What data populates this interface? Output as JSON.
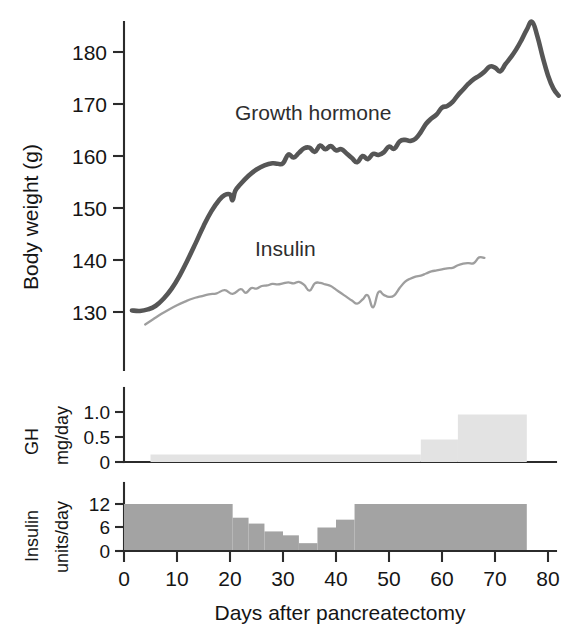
{
  "figure": {
    "title": "",
    "background_color": "#ffffff"
  },
  "chart_data": {
    "type": "line",
    "title": "",
    "subtitle": "",
    "xlabel": "Days after pancreatectomy",
    "ylabel": "Body weight (g)",
    "xlim": [
      -2,
      86
    ],
    "ylim": [
      124,
      188
    ],
    "grid": false,
    "legend_position": "inline-annotation",
    "x_ticks": [
      0,
      10,
      20,
      30,
      40,
      50,
      60,
      70,
      80
    ],
    "x_tick_labels": [
      "0",
      "10",
      "20",
      "30",
      "40",
      "50",
      "60",
      "70",
      "80"
    ],
    "y_ticks": [
      130,
      140,
      150,
      160,
      170,
      180
    ],
    "y_tick_labels": [
      "130",
      "140",
      "150",
      "160",
      "170",
      "180"
    ],
    "annotations": [
      {
        "text": "Growth hormone",
        "x": 30,
        "y": 167
      },
      {
        "text": "Insulin",
        "x": 35,
        "y": 144
      }
    ],
    "series": [
      {
        "name": "Growth hormone",
        "color": "#565656",
        "line_width": 4.6,
        "x": [
          1.5,
          3,
          4.5,
          6,
          7.5,
          9,
          10.5,
          12,
          13.5,
          15,
          16.5,
          18,
          19,
          20,
          20.5,
          21,
          22,
          23.5,
          25,
          26.5,
          28,
          29,
          30,
          31,
          32,
          33,
          34,
          35,
          36,
          37,
          38,
          39,
          40,
          41,
          42,
          43,
          44,
          45,
          46,
          47,
          48,
          49,
          50,
          51,
          52,
          53,
          54,
          55,
          56,
          57,
          58,
          59,
          60,
          61,
          62,
          63,
          64,
          65,
          66,
          67,
          68,
          69,
          70,
          71,
          72,
          73,
          74,
          75,
          76,
          77,
          78,
          79,
          80,
          81,
          82
        ],
        "y": [
          130.3,
          130.2,
          130.5,
          131.2,
          132.6,
          134.5,
          137.0,
          140.0,
          143.2,
          146.5,
          149.4,
          151.6,
          152.5,
          152.6,
          151.5,
          153.3,
          154.6,
          156.2,
          157.4,
          158.2,
          158.6,
          158.5,
          158.6,
          160.3,
          159.7,
          160.6,
          161.5,
          161.6,
          160.8,
          162.0,
          161.3,
          161.9,
          161.1,
          161.3,
          160.5,
          159.6,
          158.8,
          160.0,
          159.4,
          160.4,
          160.2,
          160.7,
          161.8,
          161.4,
          162.8,
          163.1,
          162.9,
          163.3,
          164.6,
          166.2,
          167.2,
          168.0,
          169.3,
          169.6,
          170.4,
          171.7,
          172.8,
          173.9,
          174.8,
          175.4,
          176.2,
          177.2,
          177.0,
          176.3,
          177.7,
          179.0,
          180.5,
          182.3,
          184.3,
          185.8,
          183.0,
          179.0,
          175.5,
          173.0,
          171.6
        ]
      },
      {
        "name": "Insulin",
        "color": "#9e9e9e",
        "line_width": 2.3,
        "x": [
          4,
          5.5,
          7,
          8.5,
          10,
          11.5,
          13,
          14.5,
          16,
          17.5,
          19,
          20.5,
          22,
          23,
          24,
          25,
          26,
          27,
          28,
          29,
          30,
          31,
          32,
          33,
          34,
          35,
          36,
          37,
          38,
          39,
          40,
          41,
          42,
          43,
          44,
          45,
          46,
          47,
          48,
          49,
          50,
          51,
          52,
          53,
          54,
          55,
          56,
          57,
          58,
          59,
          60,
          61,
          62,
          63,
          64,
          65,
          66,
          67,
          68
        ],
        "y": [
          127.6,
          128.6,
          129.6,
          130.5,
          131.3,
          132.0,
          132.6,
          133.0,
          133.4,
          133.6,
          134.2,
          133.5,
          134.4,
          133.7,
          134.6,
          134.5,
          135.0,
          135.1,
          135.4,
          135.3,
          135.5,
          135.7,
          135.5,
          135.8,
          135.2,
          134.1,
          135.5,
          135.6,
          135.3,
          135.0,
          134.3,
          133.6,
          132.9,
          132.2,
          131.6,
          132.4,
          133.2,
          130.9,
          133.8,
          133.3,
          132.9,
          133.2,
          134.6,
          135.8,
          136.4,
          136.8,
          137.0,
          137.4,
          137.8,
          138.0,
          138.2,
          138.4,
          138.5,
          139.0,
          139.3,
          139.4,
          139.4,
          140.5,
          140.4
        ]
      }
    ]
  },
  "gh_panel": {
    "ylabel_line1": "GH",
    "ylabel_line2": "mg/day",
    "y_ticks": [
      0,
      0.5,
      1.0
    ],
    "y_tick_labels": [
      "0",
      "0.5",
      "1.0"
    ],
    "ylim": [
      0,
      1.25
    ],
    "bar_color": "#e3e3e3",
    "type": "step",
    "steps": [
      {
        "x_start": 5,
        "x_end": 56,
        "value": 0.15
      },
      {
        "x_start": 56,
        "x_end": 63,
        "value": 0.45
      },
      {
        "x_start": 63,
        "x_end": 76,
        "value": 0.95
      }
    ]
  },
  "insulin_panel": {
    "ylabel_line1": "Insulin",
    "ylabel_line2": "units/day",
    "y_ticks": [
      0,
      6,
      12
    ],
    "y_tick_labels": [
      "0",
      "6",
      "12"
    ],
    "ylim": [
      0,
      14
    ],
    "bar_color": "#a3a3a3",
    "type": "step",
    "steps": [
      {
        "x_start": 0,
        "x_end": 20.5,
        "value": 12
      },
      {
        "x_start": 20.5,
        "x_end": 23.5,
        "value": 8.5
      },
      {
        "x_start": 23.5,
        "x_end": 26.5,
        "value": 7
      },
      {
        "x_start": 26.5,
        "x_end": 30,
        "value": 5
      },
      {
        "x_start": 30,
        "x_end": 33,
        "value": 4
      },
      {
        "x_start": 33,
        "x_end": 36.5,
        "value": 2
      },
      {
        "x_start": 36.5,
        "x_end": 40,
        "value": 6
      },
      {
        "x_start": 40,
        "x_end": 43.5,
        "value": 8
      },
      {
        "x_start": 43.5,
        "x_end": 76,
        "value": 12
      }
    ]
  }
}
